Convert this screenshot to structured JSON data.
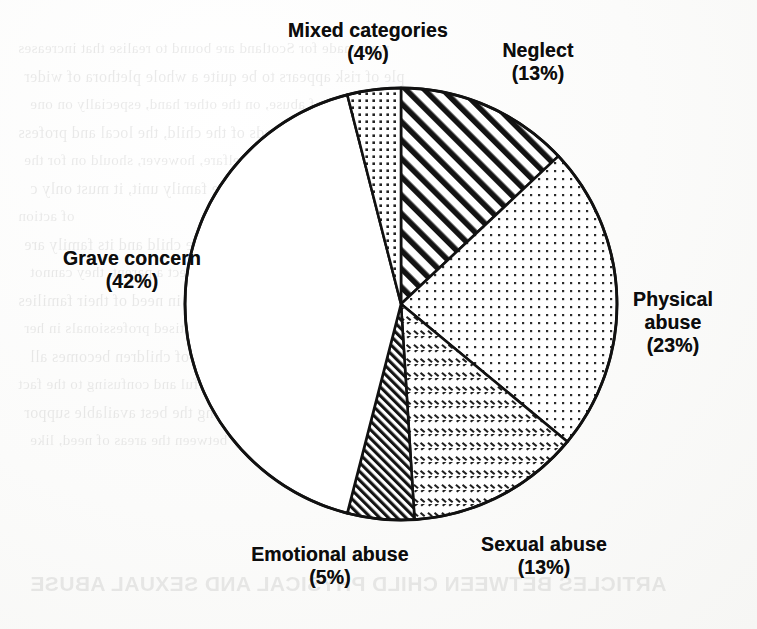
{
  "chart_data": {
    "type": "pie",
    "title": "",
    "subtitle": "",
    "xlabel": "",
    "ylabel": "",
    "legend_position": "outside-labels",
    "grid": false,
    "units": "percent",
    "total": 100,
    "start_angle_deg": 0,
    "direction": "clockwise",
    "categories": [
      "Neglect",
      "Physical abuse",
      "Sexual abuse",
      "Emotional abuse",
      "Grave concern",
      "Mixed categories"
    ],
    "values": [
      13,
      23,
      13,
      5,
      42,
      4
    ],
    "slices": [
      {
        "label": "Neglect",
        "value": 13,
        "percent_text": "(13%)",
        "pattern": "diagonal-stripes-wide",
        "label_lines": [
          "Neglect",
          "(13%)"
        ],
        "label_x": 538,
        "label_y": 62
      },
      {
        "label": "Physical abuse",
        "value": 23,
        "percent_text": "(23%)",
        "pattern": "dots-fine",
        "label_lines": [
          "Physical",
          "abuse",
          "(23%)"
        ],
        "label_x": 673,
        "label_y": 322
      },
      {
        "label": "Sexual abuse",
        "value": 13,
        "percent_text": "(13%)",
        "pattern": "crosshatch-dashes",
        "label_lines": [
          "Sexual abuse",
          "(13%)"
        ],
        "label_x": 544,
        "label_y": 556
      },
      {
        "label": "Emotional abuse",
        "value": 5,
        "percent_text": "(5%)",
        "pattern": "diagonal-stripes-dense",
        "label_lines": [
          "Emotional abuse",
          "(5%)"
        ],
        "label_x": 330,
        "label_y": 566
      },
      {
        "label": "Grave concern",
        "value": 42,
        "percent_text": "(42%)",
        "pattern": "solid-white",
        "label_lines": [
          "Grave concern",
          "(42%)"
        ],
        "label_x": 132,
        "label_y": 270
      },
      {
        "label": "Mixed categories",
        "value": 4,
        "percent_text": "(4%)",
        "pattern": "dots-medium",
        "label_lines": [
          "Mixed categories",
          "(4%)"
        ],
        "label_x": 368,
        "label_y": 42
      }
    ],
    "geometry": {
      "center_x": 401,
      "center_y": 304,
      "radius": 216
    },
    "colors": {
      "outline": "#111111",
      "fill": "#ffffff",
      "pattern_ink": "#1a1a1a",
      "background": "#fdfdfc"
    }
  },
  "page": {
    "background_ghost_text": [
      "we a made for Scotland are bound to realise that increases",
      "ple of risk appears to be quite a whole plethora of wider",
      "at work the acts of abuse, on the other hand, especially on one",
      "his were that the needs of the child, the local and profess",
      "ed, and only when a child's welfare, however, should on for the",
      "ild's needs in which it is held in the family unit, it must only c",
      "of action",
      "on those who are involved with the child and its family are",
      "an a child which have to be made to protect a parent, they cannot",
      "rcumstances where the child were in need of their families",
      "supported in the community, with practised professionals in her",
      "to survive the problems of the sexual abuse of children becomes all",
      "the worst and can be a powerful and confusing to the fact",
      "een described as a dark figure, even among the best available suppor",
      "this will vary between the areas of need, like"
    ],
    "footer_ghost_text": "ARTICLES BETWEEN CHILD PHYSICAL AND SEXUAL ABUSE"
  }
}
